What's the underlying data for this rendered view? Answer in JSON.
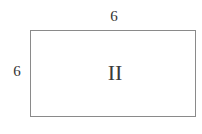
{
  "diagram": {
    "shape": "rectangle",
    "top_dimension": "6",
    "side_dimension": "6",
    "region_label": "II"
  }
}
